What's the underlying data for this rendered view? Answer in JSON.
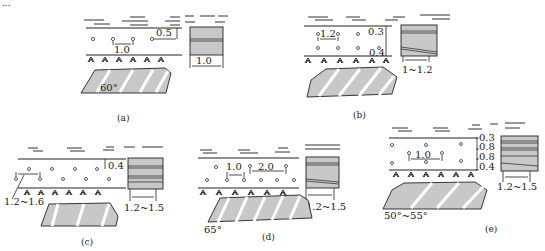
{
  "header_fragment": "...",
  "panels": [
    {
      "id": "a",
      "caption": "(a)",
      "hole_spacing": "1.0",
      "top_offset": "0.5",
      "block_width": "1.0",
      "angle": "60°"
    },
    {
      "id": "b",
      "caption": "(b)",
      "hole_spacing": "1.2",
      "top_offset": "0.3",
      "bottom_offset": "0.4",
      "block_width": "1~1.2"
    },
    {
      "id": "c",
      "caption": "(c)",
      "hole_spacing": "1.2~1.6",
      "top_offset": "0.4",
      "block_width": "1.2~1.5"
    },
    {
      "id": "d",
      "caption": "(d)",
      "hole_spacing_1": "1.0",
      "hole_spacing_2": "2.0",
      "block_width": "1.2~1.5",
      "angle": "65°"
    },
    {
      "id": "e",
      "caption": "(e)",
      "hole_spacing": "1.0",
      "offsets": [
        "0.3",
        "0.8",
        "0.8",
        "0.4"
      ],
      "block_width": "1.2~1.5",
      "angle": "50°~55°"
    }
  ]
}
